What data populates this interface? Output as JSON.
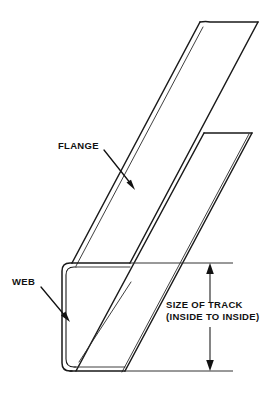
{
  "diagram": {
    "background_color": "#ffffff",
    "line_color": "#1a1a1a",
    "text_color": "#111111"
  },
  "labels": {
    "flange": "FLANGE",
    "web": "WEB",
    "dimension_line_1": "SIZE OF TRACK",
    "dimension_line_2": "(INSIDE TO INSIDE)"
  },
  "callouts": [
    {
      "name": "flange-callout",
      "text": "FLANGE",
      "leader_from": [
        104,
        150
      ],
      "leader_to": [
        133,
        186
      ],
      "arrow_direction": "down-right"
    },
    {
      "name": "web-callout",
      "text": "WEB",
      "leader_from": [
        42,
        288
      ],
      "leader_to": [
        69,
        320
      ],
      "arrow_direction": "down-right"
    }
  ],
  "dimension": {
    "name": "size-of-track",
    "text_line_1": "SIZE OF TRACK",
    "text_line_2": "(INSIDE TO INSIDE)",
    "orientation": "vertical",
    "x": 210,
    "top_y": 263,
    "bottom_y": 371,
    "extension_top_y": 263,
    "extension_bottom_y": 371,
    "extension_x_start": 130,
    "extension_x_end": 233,
    "arrow_ends": "both"
  },
  "geometry": {
    "projection": "oblique",
    "web": {
      "x_outer": 62,
      "x_inner": 70,
      "top_y": 263,
      "bottom_y": 371,
      "corner_radius": 8,
      "thickness_px": 4
    },
    "upper_flange": {
      "near_bottom_left": [
        72,
        263
      ],
      "near_bottom_right": [
        130,
        263
      ],
      "far_top_left": [
        200,
        22
      ],
      "far_top_right": [
        258,
        22
      ]
    },
    "lower_flange": {
      "near_left": [
        72,
        371
      ],
      "near_right": [
        130,
        371
      ],
      "far_top_left": [
        204,
        133
      ],
      "far_top_right": [
        252,
        133
      ]
    }
  }
}
